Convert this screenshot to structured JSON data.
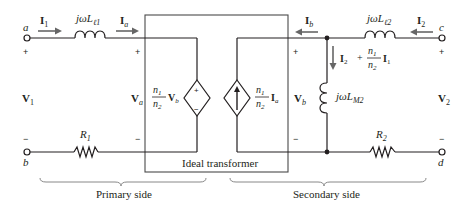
{
  "diagram": {
    "type": "circuit",
    "terminals": {
      "a": "a",
      "b": "b",
      "c": "c",
      "d": "d"
    },
    "currents": {
      "I1": {
        "main": "I",
        "sub": "1"
      },
      "Ia": {
        "main": "I",
        "sub": "a"
      },
      "Ib": {
        "main": "I",
        "sub": "b"
      },
      "I2": {
        "main": "I",
        "sub": "2"
      },
      "branch": {
        "i2_main": "I",
        "i2_sub": "2",
        "plus": "+",
        "frac_num": "n",
        "frac_num_sub": "1",
        "frac_den": "n",
        "frac_den_sub": "2",
        "i1_main": "I",
        "i1_sub": "1"
      }
    },
    "voltages": {
      "V1": {
        "main": "V",
        "sub": "1"
      },
      "Va": {
        "main": "V",
        "sub": "a"
      },
      "Vb": {
        "main": "V",
        "sub": "b"
      },
      "V2": {
        "main": "V",
        "sub": "2"
      }
    },
    "components": {
      "L_l1": {
        "prefix": "jωL",
        "sub": "ℓ1"
      },
      "L_l2": {
        "prefix": "jωL",
        "sub": "ℓ2"
      },
      "L_M2": {
        "prefix": "jωL",
        "sub": "M2"
      },
      "R1": {
        "main": "R",
        "sub": "1"
      },
      "R2": {
        "main": "R",
        "sub": "2"
      },
      "voltage_source": {
        "frac_num": "n",
        "frac_num_sub": "1",
        "frac_den": "n",
        "frac_den_sub": "2",
        "var_main": "V",
        "var_sub": "b",
        "plus": "+",
        "minus": "−"
      },
      "current_source": {
        "frac_num": "n",
        "frac_num_sub": "1",
        "frac_den": "n",
        "frac_den_sub": "2",
        "var_main": "I",
        "var_sub": "a"
      }
    },
    "signs": {
      "plus": "+",
      "minus": "−"
    },
    "ideal_transformer_label": "Ideal transformer",
    "sides": {
      "primary": "Primary side",
      "secondary": "Secondary side"
    }
  }
}
